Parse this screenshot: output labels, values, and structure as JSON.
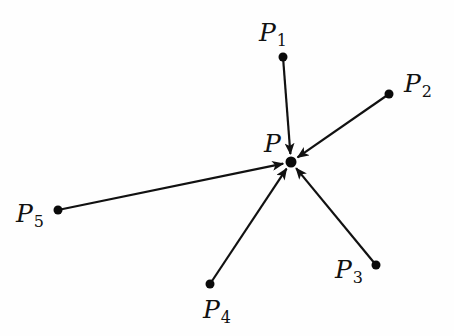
{
  "diagram": {
    "type": "vector-diagram",
    "center": {
      "id": "P",
      "label": "P",
      "subscript": "",
      "x": 291,
      "y": 162,
      "label_x": 264,
      "label_y": 152
    },
    "points": [
      {
        "id": "P1",
        "label": "P",
        "subscript": "1",
        "x": 283,
        "y": 57,
        "label_x": 259,
        "label_y": 41
      },
      {
        "id": "P2",
        "label": "P",
        "subscript": "2",
        "x": 389,
        "y": 94,
        "label_x": 404,
        "label_y": 92
      },
      {
        "id": "P3",
        "label": "P",
        "subscript": "3",
        "x": 376,
        "y": 265,
        "label_x": 335,
        "label_y": 278
      },
      {
        "id": "P4",
        "label": "P",
        "subscript": "4",
        "x": 210,
        "y": 284,
        "label_x": 203,
        "label_y": 318
      },
      {
        "id": "P5",
        "label": "P",
        "subscript": "5",
        "x": 58,
        "y": 210,
        "label_x": 16,
        "label_y": 222
      }
    ],
    "edges": [
      {
        "from": "P1",
        "to": "P",
        "arrow": "end"
      },
      {
        "from": "P2",
        "to": "P",
        "arrow": "end"
      },
      {
        "from": "P3",
        "to": "P",
        "arrow": "end"
      },
      {
        "from": "P4",
        "to": "P",
        "arrow": "end"
      },
      {
        "from": "P5",
        "to": "P",
        "arrow": "end"
      }
    ],
    "colors": {
      "ink": "#111111",
      "background": "#fefefe"
    }
  }
}
